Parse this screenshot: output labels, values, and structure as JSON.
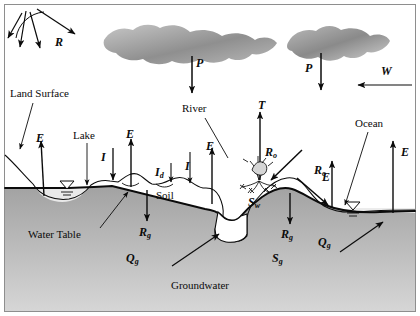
{
  "figure": {
    "background_color": "#ffffff",
    "border_color": "#8c8c8c",
    "groundwater_fill_top": "#a9a9a9",
    "groundwater_fill_bottom": "#d2d2d2",
    "cloud_color": "#9a9a9a",
    "ink_color": "#0b0b0b"
  },
  "regions": {
    "land_surface": "Land Surface",
    "lake": "Lake",
    "river": "River",
    "ocean": "Ocean",
    "soil": "Soil",
    "water_table": "Water Table",
    "groundwater": "Groundwater"
  },
  "symbols": {
    "radiation": {
      "base": "R",
      "sub": "",
      "name": "net-radiation"
    },
    "precipitation_river": {
      "base": "P",
      "sub": "",
      "name": "precipitation-river"
    },
    "precipitation_ocean": {
      "base": "P",
      "sub": "",
      "name": "precipitation-ocean"
    },
    "wind": {
      "base": "W",
      "sub": "",
      "name": "wind-advection"
    },
    "transpiration": {
      "base": "T",
      "sub": "",
      "name": "transpiration"
    },
    "evaporation_lake_left": {
      "base": "E",
      "sub": "",
      "name": "evaporation-lake-left"
    },
    "evaporation_land": {
      "base": "E",
      "sub": "",
      "name": "evaporation-land"
    },
    "evaporation_soil": {
      "base": "E",
      "sub": "",
      "name": "evaporation-soil"
    },
    "evaporation_ocean_left": {
      "base": "E",
      "sub": "",
      "name": "evaporation-ocean-left"
    },
    "evaporation_ocean_right": {
      "base": "E",
      "sub": "",
      "name": "evaporation-ocean-right"
    },
    "infiltration_lake": {
      "base": "I",
      "sub": "",
      "name": "infiltration-lake"
    },
    "infiltration_depression": {
      "base": "I",
      "sub": "d",
      "name": "infiltration-depression"
    },
    "infiltration_soil": {
      "base": "I",
      "sub": "",
      "name": "infiltration-soil"
    },
    "recharge_left": {
      "base": "R",
      "sub": "g",
      "name": "groundwater-recharge-left"
    },
    "recharge_right": {
      "base": "R",
      "sub": "g",
      "name": "groundwater-recharge-right"
    },
    "runoff_left": {
      "base": "R",
      "sub": "o",
      "name": "overland-runoff-left"
    },
    "runoff_right": {
      "base": "R",
      "sub": "o",
      "name": "overland-runoff-right"
    },
    "discharge_river": {
      "base": "Q",
      "sub": "g",
      "name": "groundwater-discharge-river"
    },
    "discharge_ocean": {
      "base": "Q",
      "sub": "g",
      "name": "groundwater-discharge-ocean"
    },
    "soil_water_storage": {
      "base": "S",
      "sub": "w",
      "name": "soil-water-storage"
    },
    "groundwater_storage": {
      "base": "S",
      "sub": "g",
      "name": "groundwater-storage"
    }
  }
}
